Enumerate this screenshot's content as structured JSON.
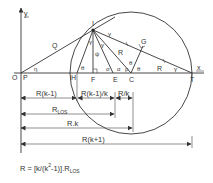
{
  "diagram": {
    "axes": {
      "x_label": "x",
      "y_label": "y",
      "origin_label": "O"
    },
    "points": {
      "P": "P",
      "H": "H",
      "F": "F",
      "E": "E",
      "C": "C",
      "T": "T",
      "I": "I",
      "G": "G"
    },
    "segment_labels": {
      "Q": "Q",
      "R_IC": "R",
      "R_CT": "R"
    },
    "angle_labels": {
      "eta_P": "η",
      "theta_H": "θ",
      "gamma_IF": "γ",
      "psi_IF": "ψ",
      "gamma_IE": "γ",
      "sigma_E": "σ",
      "alpha_E": "α",
      "rho_C": "ρ",
      "theta_C_left": "θ",
      "theta_C_right": "θ",
      "gamma_T": "γ",
      "gamma_I_top": "γ",
      "tick_T": "T"
    },
    "dimensions": [
      {
        "label": "R(k-1)"
      },
      {
        "label": "R(k-1)/k"
      },
      {
        "label": "R/k"
      },
      {
        "label": "R",
        "subscript": "LOS"
      },
      {
        "label": "R.k"
      },
      {
        "label": "R(k+1)"
      }
    ],
    "formula": {
      "prefix": "R = [k/(k",
      "sup": "2",
      "middle": "-1)].R",
      "sub": "LOS"
    }
  }
}
